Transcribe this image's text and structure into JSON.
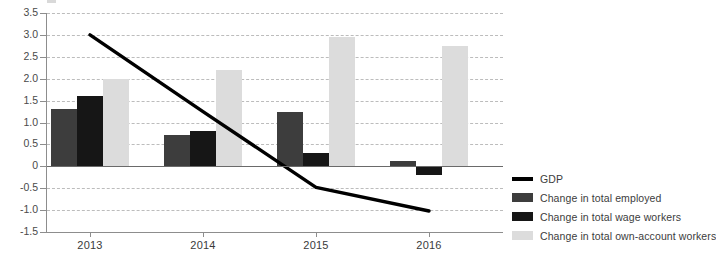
{
  "chart_data": {
    "type": "bar",
    "title": "",
    "subtitle": "",
    "xlabel": "",
    "ylabel": "",
    "categories": [
      "2013",
      "2014",
      "2015",
      "2016"
    ],
    "ylim": [
      -1.5,
      3.5
    ],
    "ytick_step": 0.5,
    "yticks": [
      "3.5",
      "3.0",
      "2.5",
      "2.0",
      "1.5",
      "1.0",
      "0.5",
      "0",
      "-0.5",
      "-1.0",
      "-1.5"
    ],
    "ytick_values": [
      3.5,
      3.0,
      2.5,
      2.0,
      1.5,
      1.0,
      0.5,
      0,
      -0.5,
      -1.0,
      -1.5
    ],
    "grid": true,
    "legend_position": "right",
    "series": [
      {
        "name": "Change in total employed",
        "type": "bar",
        "color": "#3d3d3d",
        "values": [
          1.3,
          0.72,
          1.25,
          0.13
        ]
      },
      {
        "name": "Change in total wage workers",
        "type": "bar",
        "color": "#161616",
        "values": [
          1.6,
          0.8,
          0.3,
          -0.21
        ]
      },
      {
        "name": "Change in total own-account workers",
        "type": "bar",
        "color": "#dcdcdc",
        "values": [
          2.0,
          2.2,
          2.95,
          2.75
        ]
      },
      {
        "name": "GDP",
        "type": "line",
        "color": "#000000",
        "values": [
          3.0,
          1.25,
          -0.48,
          -1.02
        ]
      }
    ]
  },
  "legend": {
    "items": [
      {
        "label": "GDP",
        "color": "#000000",
        "kind": "line"
      },
      {
        "label": "Change in total employed",
        "color": "#3d3d3d",
        "kind": "bar"
      },
      {
        "label": "Change in total wage workers",
        "color": "#161616",
        "kind": "bar"
      },
      {
        "label": "Change in total own-account workers",
        "color": "#dcdcdc",
        "kind": "bar"
      }
    ]
  },
  "colors": {
    "employed": "#3d3d3d",
    "wage_workers": "#161616",
    "own_account": "#dcdcdc",
    "gdp_line": "#000000",
    "grid": "#bcbcbc",
    "axis": "#8d8d8d"
  }
}
